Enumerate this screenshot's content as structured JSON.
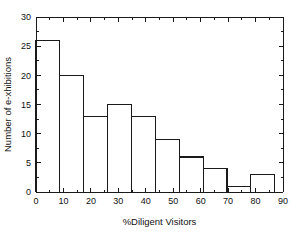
{
  "chart_data": {
    "type": "bar",
    "title": "",
    "subtitle": "",
    "xlabel": "%Diligent Visitors",
    "ylabel": "Number of e-xhibitions",
    "xlim": [
      0,
      90
    ],
    "ylim": [
      0,
      30
    ],
    "grid": false,
    "legend": null,
    "bin_width": 8.7,
    "categories": [
      "0-8.7",
      "8.7-17.4",
      "17.4-26.1",
      "26.1-34.8",
      "34.8-43.5",
      "43.5-52.2",
      "52.2-60.9",
      "60.9-69.6",
      "69.6-78.3",
      "78.3-87"
    ],
    "bin_edges": [
      0,
      8.7,
      17.4,
      26.1,
      34.8,
      43.5,
      52.2,
      60.9,
      69.6,
      78.3,
      87
    ],
    "values": [
      26,
      20,
      13,
      15,
      13,
      9,
      6,
      4,
      1,
      3
    ],
    "xticks": [
      0,
      10,
      20,
      30,
      40,
      50,
      60,
      70,
      80,
      90
    ],
    "xtick_labels": [
      "0",
      "10",
      "20",
      "30",
      "40",
      "50",
      "60",
      "70",
      "80",
      "90"
    ],
    "yticks": [
      0,
      5,
      10,
      15,
      20,
      25,
      30
    ],
    "ytick_labels": [
      "0",
      "5",
      "10",
      "15",
      "20",
      "25",
      "30"
    ],
    "x_minor_step": 5,
    "y_minor_step": 2.5,
    "colors": {
      "background": "#ffffff",
      "axis": "#1a1a1a",
      "bar_edge": "#1a1a1a",
      "bar_fill": "none",
      "text": "#111111"
    }
  },
  "axes": {
    "x_title": "%Diligent Visitors",
    "y_title": "Number of e-xhibitions"
  }
}
